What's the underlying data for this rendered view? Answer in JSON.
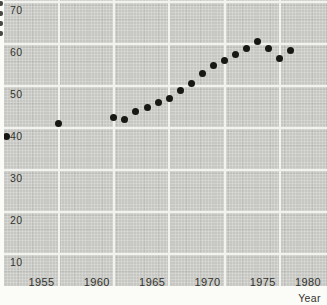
{
  "chart_data": {
    "type": "scatter",
    "title": "",
    "xlabel": "Year",
    "ylabel": "",
    "x": [
      1950,
      1955,
      1960,
      1961,
      1962,
      1963,
      1964,
      1965,
      1966,
      1967,
      1968,
      1969,
      1970,
      1971,
      1972,
      1973,
      1974,
      1975,
      1976
    ],
    "y": [
      38,
      41,
      42.5,
      42,
      44,
      45,
      46,
      47,
      49,
      50.5,
      53,
      55,
      56,
      57.5,
      59,
      60.5,
      59,
      56.5,
      58.5
    ],
    "x_ticks": [
      1955,
      1960,
      1965,
      1970,
      1975,
      1980
    ],
    "y_ticks": [
      70,
      60,
      50,
      40,
      30,
      20,
      10
    ],
    "xlim": [
      1950,
      1980
    ],
    "ylim": [
      3,
      70
    ],
    "grid": true,
    "legend_position": "none",
    "marker": "filled-circle",
    "colors": {
      "point": "#171714",
      "plot_background": "#c6c7c2",
      "gridline": "#f2f3ee",
      "tick_text": "#33332e",
      "page_background": "#fbfbf8"
    }
  }
}
